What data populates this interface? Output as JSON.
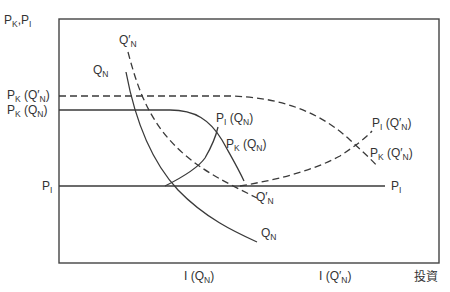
{
  "diagram": {
    "y_axis_label": {
      "main": "P",
      "sub1": "K",
      "sep": ",P",
      "sub2": "I"
    },
    "x_axis_label": "投資",
    "y_ticks": [
      {
        "main": "P",
        "sub": "K",
        "rest1": " (Q′",
        "sub2": "N",
        "rest2": ")"
      },
      {
        "main": "P",
        "sub": "K",
        "rest1": " (Q",
        "sub2": "N",
        "rest2": ")"
      },
      {
        "main": "P",
        "sub": "I",
        "rest1": "",
        "sub2": "",
        "rest2": ""
      }
    ],
    "x_ticks": [
      {
        "main": "I (Q",
        "sub": "N",
        "rest": ")"
      },
      {
        "main": "I (Q′",
        "sub": "N",
        "rest": ")"
      }
    ],
    "curve_labels": {
      "qn_top": {
        "main": "Q",
        "sub": "N"
      },
      "qpn_top": {
        "main": "Q′",
        "sub": "N"
      },
      "pi_qn": {
        "main": "P",
        "sub": "I",
        "rest1": " (Q",
        "sub2": "N",
        "rest2": ")"
      },
      "pk_qn": {
        "main": "P",
        "sub": "K",
        "rest1": " (Q",
        "sub2": "N",
        "rest2": ")"
      },
      "pi_qpn": {
        "main": "P",
        "sub": "I",
        "rest1": " (Q′",
        "sub2": "N",
        "rest2": ")"
      },
      "pk_qpn": {
        "main": "P",
        "sub": "K",
        "rest1": " (Q′",
        "sub2": "N",
        "rest2": ")"
      },
      "qpn_bottom": {
        "main": "Q′",
        "sub": "N"
      },
      "qn_bottom": {
        "main": "Q",
        "sub": "N"
      },
      "pi_right": {
        "main": "P",
        "sub": "I"
      }
    }
  }
}
